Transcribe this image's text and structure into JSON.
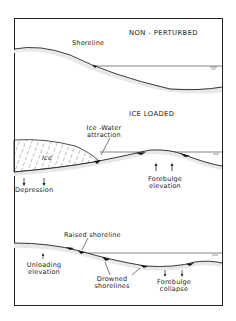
{
  "panels": {
    "top": {
      "title": "NON - PERTURBED",
      "labels": {
        "shoreline": "Shoreline"
      }
    },
    "middle": {
      "title": "ICE LOADED",
      "labels": {
        "ice": "Ice",
        "ice_water_1": "Ice -Water",
        "ice_water_2": "attraction",
        "depression": "Depression",
        "forebulge_1": "Forebulge",
        "forebulge_2": "elevation"
      }
    },
    "bottom": {
      "labels": {
        "raised": "Raised shoreline",
        "unloading_1": "Unloading",
        "unloading_2": "elevation",
        "drowned_1": "Drowned",
        "drowned_2": "shorelines",
        "collapse_1": "Forebulge",
        "collapse_2": "collapse"
      }
    }
  },
  "icons": {
    "water_level": "water-level-symbol",
    "arrow_down": "down-arrow",
    "arrow_up": "up-arrow"
  }
}
